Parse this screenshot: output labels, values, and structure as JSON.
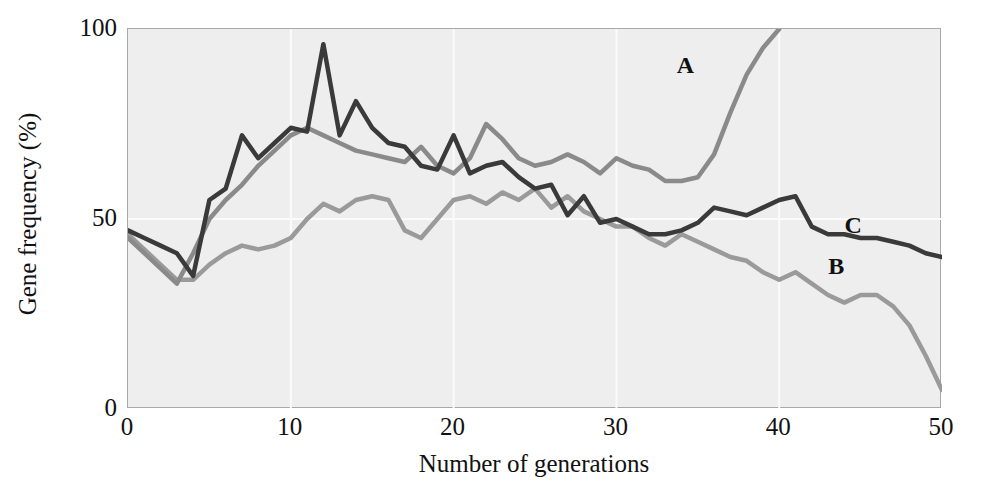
{
  "chart_data": {
    "type": "line",
    "title": "",
    "xlabel": "Number of generations",
    "ylabel": "Gene frequency (%)",
    "xlim": [
      0,
      50
    ],
    "ylim": [
      0,
      100
    ],
    "xticks": [
      "0",
      "10",
      "20",
      "30",
      "40",
      "50"
    ],
    "xtick_values": [
      0,
      10,
      20,
      30,
      40,
      50
    ],
    "yticks": [
      "0",
      "50",
      "100"
    ],
    "ytick_values": [
      0,
      50,
      100
    ],
    "grid": "faint white vertical gridlines at x=10,20,30,40 and horizontal at y=50",
    "legend_position": "inline annotations on curves",
    "plot_background": "#eeeeee",
    "axis_color": "#a8a8a8",
    "x": [
      0,
      1,
      2,
      3,
      4,
      5,
      6,
      7,
      8,
      9,
      10,
      11,
      12,
      13,
      14,
      15,
      16,
      17,
      18,
      19,
      20,
      21,
      22,
      23,
      24,
      25,
      26,
      27,
      28,
      29,
      30,
      31,
      32,
      33,
      34,
      35,
      36,
      37,
      38,
      39,
      40,
      41,
      42,
      43,
      44,
      45,
      46,
      47,
      48,
      49,
      50
    ],
    "series": [
      {
        "name": "A",
        "label": "A",
        "color": "#8a8a8a",
        "annotation_x": 34.2,
        "annotation_y": 90,
        "values": [
          45,
          41,
          37,
          33,
          41,
          50,
          55,
          59,
          64,
          68,
          72,
          74,
          72,
          70,
          68,
          67,
          66,
          65,
          69,
          64,
          62,
          66,
          75,
          71,
          66,
          64,
          65,
          67,
          65,
          62,
          66,
          64,
          63,
          60,
          60,
          61,
          67,
          78,
          88,
          95,
          100,
          null,
          null,
          null,
          null,
          null,
          null,
          null,
          null,
          null,
          null
        ]
      },
      {
        "name": "B",
        "label": "B",
        "color": "#9a9a9a",
        "annotation_x": 43.5,
        "annotation_y": 37,
        "values": [
          46,
          42,
          38,
          34,
          34,
          38,
          41,
          43,
          42,
          43,
          45,
          50,
          54,
          52,
          55,
          56,
          55,
          47,
          45,
          50,
          55,
          56,
          54,
          57,
          55,
          58,
          53,
          56,
          52,
          50,
          48,
          48,
          45,
          43,
          46,
          44,
          42,
          40,
          39,
          36,
          34,
          36,
          33,
          30,
          28,
          30,
          30,
          27,
          22,
          14,
          5
        ]
      },
      {
        "name": "C",
        "label": "C",
        "color": "#3a3a3a",
        "annotation_x": 44.5,
        "annotation_y": 48,
        "values": [
          47,
          45,
          43,
          41,
          35,
          55,
          58,
          72,
          66,
          70,
          74,
          73,
          96,
          72,
          81,
          74,
          70,
          69,
          64,
          63,
          72,
          62,
          64,
          65,
          61,
          58,
          59,
          51,
          56,
          49,
          50,
          48,
          46,
          46,
          47,
          49,
          53,
          52,
          51,
          53,
          55,
          56,
          48,
          46,
          46,
          45,
          45,
          44,
          43,
          41,
          40
        ]
      }
    ]
  }
}
